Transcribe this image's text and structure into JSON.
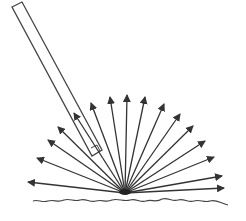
{
  "diagram": {
    "colors": {
      "stroke": "#333333",
      "background": "#ffffff"
    },
    "origin": {
      "x": 125,
      "y": 193
    },
    "incident_beam": {
      "label": "incident-light-beam"
    },
    "reflected_rays": [
      {
        "x": 28,
        "y": 182
      },
      {
        "x": 37,
        "y": 158
      },
      {
        "x": 48,
        "y": 140
      },
      {
        "x": 58,
        "y": 127
      },
      {
        "x": 74,
        "y": 113
      },
      {
        "x": 91,
        "y": 103
      },
      {
        "x": 110,
        "y": 97
      },
      {
        "x": 127,
        "y": 95
      },
      {
        "x": 145,
        "y": 97
      },
      {
        "x": 164,
        "y": 104
      },
      {
        "x": 180,
        "y": 114
      },
      {
        "x": 193,
        "y": 126
      },
      {
        "x": 205,
        "y": 141
      },
      {
        "x": 214,
        "y": 157
      },
      {
        "x": 222,
        "y": 176
      },
      {
        "x": 224,
        "y": 188
      }
    ],
    "surface": {
      "label": "rough-surface"
    }
  }
}
